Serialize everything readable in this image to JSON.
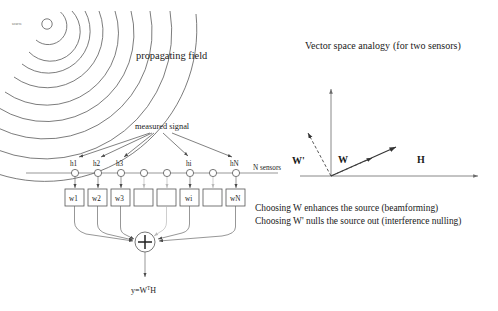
{
  "figure": {
    "background": "#ffffff",
    "ink_color": "#1a1a1a"
  },
  "left_panel": {
    "source_label": "source",
    "field_label": "propagating field",
    "measured_signal_label": "measured signal",
    "array_label": "N sensors",
    "sensor_labels": [
      "h1",
      "h2",
      "h3",
      "hi",
      "hN"
    ],
    "weight_labels": [
      "w1",
      "w2",
      "w3",
      "wi",
      "wN"
    ],
    "summer_symbol": "+",
    "output": {
      "base": "y=W",
      "superscript": "T",
      "tail": "H"
    },
    "sensor_count": 8,
    "labeled_sensor_indices": [
      0,
      1,
      2,
      5,
      7
    ],
    "wavefront_count": 9
  },
  "right_panel": {
    "title": "Vector space analogy",
    "title_paren": "(for two sensors)",
    "vectors": [
      {
        "name": "H",
        "label": "H",
        "style": "solid",
        "direction": "up-right"
      },
      {
        "name": "W",
        "label": "W",
        "style": "dashed",
        "direction": "up-right-short"
      },
      {
        "name": "Wp",
        "label": "W'",
        "style": "dashed",
        "direction": "up-left"
      }
    ],
    "axes": {
      "x": "horizontal",
      "y": "vertical"
    },
    "captions": [
      "Choosing W enhances the source (beamforming)",
      "Choosing W' nulls the source out (interference nulling)"
    ]
  }
}
